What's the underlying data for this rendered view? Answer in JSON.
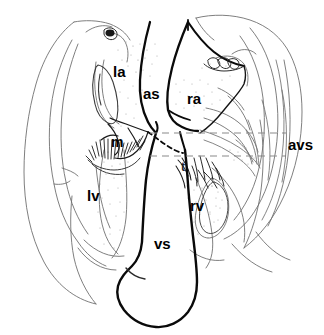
{
  "figure": {
    "background_color": "#ffffff",
    "ink_color": "#000000",
    "faint_ink_color": "#6b6b6b",
    "dash_color": "#8a8a8a",
    "width": 324,
    "height": 335
  },
  "labels": {
    "la": "la",
    "as": "as",
    "ra": "ra",
    "m": "m",
    "t": "t",
    "lv": "lv",
    "rv": "rv",
    "vs": "vs",
    "avs": "avs"
  },
  "annotations": {
    "upper_dashed_line_y": 133,
    "lower_dashed_line_y": 156,
    "dashed_line_x_start": 150,
    "dashed_line_x_end": 286
  }
}
